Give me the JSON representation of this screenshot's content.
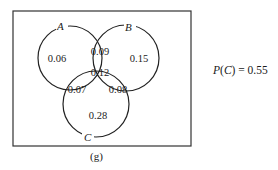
{
  "diagram": {
    "type": "venn",
    "sets": [
      {
        "name": "A",
        "label": "A"
      },
      {
        "name": "B",
        "label": "B"
      },
      {
        "name": "C",
        "label": "C"
      }
    ],
    "regions": {
      "A_only": "0.06",
      "B_only": "0.15",
      "C_only": "0.28",
      "A_and_B_only": "0.09",
      "A_and_C_only": "0.07",
      "B_and_C_only": "0.08",
      "A_and_B_and_C": "0.12"
    },
    "annotation": {
      "prefix": "P(",
      "set": "C",
      "suffix": ") = 0.55"
    },
    "caption": "(g)"
  }
}
